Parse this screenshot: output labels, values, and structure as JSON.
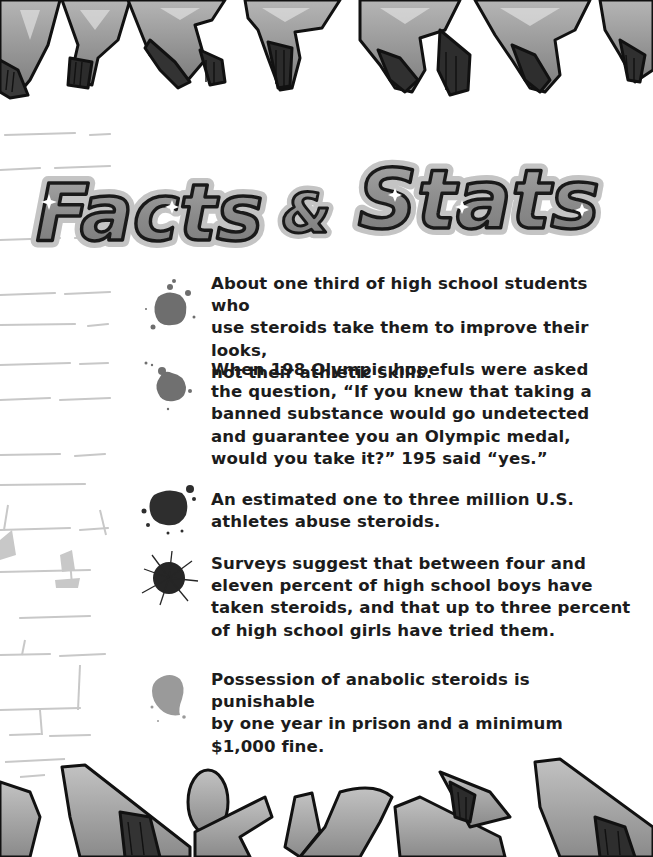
{
  "page": {
    "title_words": [
      "Facts",
      "&",
      "Stats"
    ],
    "title_alt": "Facts & Stats",
    "colors": {
      "text": "#1c1c1c",
      "title_fill": "#8c8c8c",
      "title_outline": "#1a1a1a",
      "title_halo": "#c4c4c4",
      "graffiti_fill": "#9a9a9a",
      "wall_marks": "#c8c8c8"
    }
  },
  "decor": {
    "top_banner": "graffiti-lettering-top",
    "bottom_banner": "graffiti-lettering-bottom",
    "left_wall": "brick-wall-sketch"
  },
  "facts": [
    {
      "icon": "paint-splat-icon",
      "splat_color": "#6e6e6e",
      "lines": [
        "About one third of high school students who",
        "use steroids take them to improve their looks,",
        "not their athletic skills."
      ]
    },
    {
      "icon": "paint-splat-icon",
      "splat_color": "#707070",
      "lines": [
        "When 198 Olympic hopefuls were asked",
        "the question, “If you knew that taking a",
        "banned substance would go undetected",
        "and guarantee you an Olympic medal,",
        "would you take it?” 195 said “yes.”"
      ]
    },
    {
      "icon": "paint-splat-icon",
      "splat_color": "#2e2e2e",
      "lines": [
        "An estimated one to three million U.S.",
        "athletes abuse steroids."
      ]
    },
    {
      "icon": "paint-splat-icon",
      "splat_color": "#262626",
      "lines": [
        "Surveys suggest that between four and",
        "eleven percent of high school boys have",
        "taken steroids, and that up to three percent",
        "of high school girls have tried them."
      ]
    },
    {
      "icon": "paint-splat-icon",
      "splat_color": "#9a9a9a",
      "lines": [
        "Possession of anabolic steroids is punishable",
        "by one year in prison and a minimum",
        "$1,000 fine."
      ]
    }
  ]
}
